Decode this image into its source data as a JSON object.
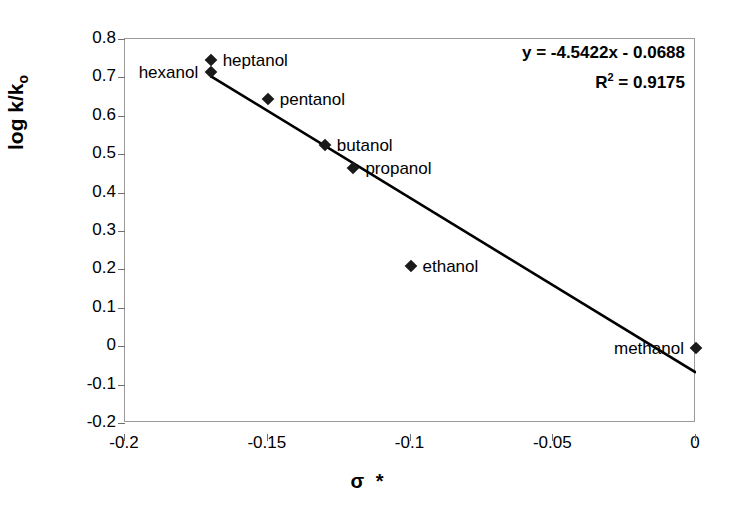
{
  "chart_data": {
    "type": "scatter",
    "title": "",
    "xlabel": "σ  *",
    "ylabel": "log k/k",
    "ylabel_sub": "o",
    "xlim": [
      -0.2,
      0.0
    ],
    "ylim": [
      -0.2,
      0.8
    ],
    "xticks": [
      "-0.2",
      "-0.15",
      "-0.1",
      "-0.05",
      "0"
    ],
    "xtick_values": [
      -0.2,
      -0.15,
      -0.1,
      -0.05,
      0
    ],
    "yticks": [
      "0.8",
      "0.7",
      "0.6",
      "0.5",
      "0.4",
      "0.3",
      "0.2",
      "0.1",
      "0",
      "-0.1",
      "-0.2"
    ],
    "ytick_values": [
      0.8,
      0.7,
      0.6,
      0.5,
      0.4,
      0.3,
      0.2,
      0.1,
      0,
      -0.1,
      -0.2
    ],
    "grid": false,
    "legend": "none",
    "x": [
      -0.17,
      -0.17,
      -0.15,
      -0.13,
      -0.12,
      -0.1,
      0.0
    ],
    "y": [
      0.745,
      0.715,
      0.645,
      0.525,
      0.465,
      0.21,
      -0.005
    ],
    "point_labels": [
      "heptanol",
      "hexanol",
      "pentanol",
      "butanol",
      "propanol",
      "ethanol",
      "methanol"
    ],
    "points": [
      {
        "label": "heptanol",
        "x": -0.17,
        "y": 0.745,
        "label_pos": "right"
      },
      {
        "label": "hexanol",
        "x": -0.17,
        "y": 0.715,
        "label_pos": "left"
      },
      {
        "label": "pentanol",
        "x": -0.15,
        "y": 0.645,
        "label_pos": "right"
      },
      {
        "label": "butanol",
        "x": -0.13,
        "y": 0.525,
        "label_pos": "right"
      },
      {
        "label": "propanol",
        "x": -0.12,
        "y": 0.465,
        "label_pos": "right"
      },
      {
        "label": "ethanol",
        "x": -0.1,
        "y": 0.21,
        "label_pos": "right"
      },
      {
        "label": "methanol",
        "x": 0.0,
        "y": -0.005,
        "label_pos": "left"
      }
    ],
    "trendline": {
      "type": "linear",
      "slope": -4.5422,
      "intercept": -0.0688,
      "r_squared": 0.9175,
      "x_start": -0.17,
      "x_end": 0.0
    },
    "annotations": {
      "equation": "y = -4.5422x - 0.0688",
      "r2_prefix": "R",
      "r2_sup": "2",
      "r2_value": " = 0.9175"
    },
    "colors": {
      "marker": "#1a1a1a",
      "trendline": "#000000",
      "axis": "#6f6f6f",
      "frame": "#9a9a9a",
      "background": "#ffffff",
      "text": "#000000"
    }
  }
}
